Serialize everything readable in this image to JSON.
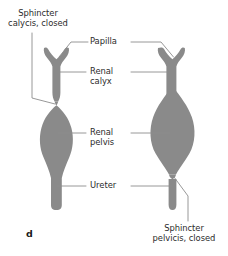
{
  "figure": {
    "panel_letter": "d",
    "organ_fill_color": "#8a8a8a",
    "leader_line_color": "#8c8c8c",
    "text_color": "#2b2b2b",
    "background_color": "#ffffff",
    "labels": {
      "sphincter_calycis": "Sphincter\ncalycis, closed",
      "papilla": "Papilla",
      "renal_calyx": "Renal\ncalyx",
      "renal_pelvis": "Renal\npelvis",
      "ureter": "Ureter",
      "sphincter_pelvicis": "Sphincter\npelvicis, closed"
    },
    "diagrams": [
      {
        "name": "left-diagram",
        "state": "calyceal sphincter closed, renal pelvis filled",
        "closed_sphincter": "sphincter calycis"
      },
      {
        "name": "right-diagram",
        "state": "pelvic sphincter closed, renal pelvis filled",
        "closed_sphincter": "sphincter pelvicis"
      }
    ]
  }
}
